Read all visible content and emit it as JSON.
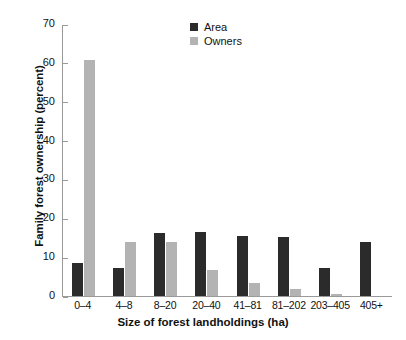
{
  "chart_data": {
    "type": "bar",
    "title": "",
    "xlabel": "Size of forest landholdings (ha)",
    "ylabel": "Family forest ownership (percent)",
    "categories": [
      "0–4",
      "4–8",
      "8–20",
      "20–40",
      "41–81",
      "81–202",
      "203–405",
      "405+"
    ],
    "series": [
      {
        "name": "Area",
        "color": "#2b2b2b",
        "values": [
          8.4,
          7.3,
          16.3,
          16.6,
          15.4,
          15.2,
          7.3,
          14.0
        ]
      },
      {
        "name": "Owners",
        "color": "#b3b3b3",
        "values": [
          60.7,
          14.0,
          13.8,
          6.6,
          3.3,
          1.7,
          0.4,
          0.0
        ]
      }
    ],
    "ylim": [
      0,
      70
    ],
    "yticks": [
      0,
      10,
      20,
      30,
      40,
      50,
      60,
      70
    ],
    "grid": false,
    "legend_position": "top-center"
  }
}
